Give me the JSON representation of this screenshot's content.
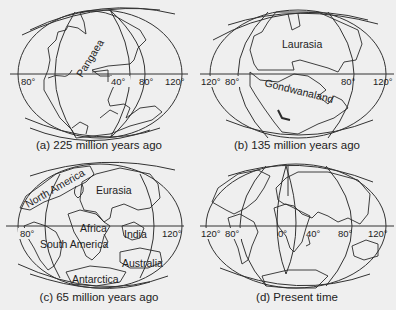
{
  "figure": {
    "background": "#efefef",
    "line_color": "#2a2a2a",
    "panels": [
      {
        "id": "a",
        "caption": "(a) 225 million years ago",
        "longitude_labels": [
          "80°",
          "40°",
          "80°",
          "120°"
        ],
        "landmass_labels": [
          "Pangaea"
        ]
      },
      {
        "id": "b",
        "caption": "(b) 135 million years ago",
        "longitude_labels": [
          "120°",
          "80°",
          "80°",
          "120°"
        ],
        "landmass_labels": [
          "Laurasia",
          "Gondwanaland"
        ]
      },
      {
        "id": "c",
        "caption": "(c) 65 million years ago",
        "longitude_labels": [
          "80°",
          "120°"
        ],
        "landmass_labels": [
          "North America",
          "Eurasia",
          "Africa",
          "South America",
          "India",
          "Australia",
          "Antarctica"
        ]
      },
      {
        "id": "d",
        "caption": "(d) Present time",
        "longitude_labels": [
          "120°",
          "80°",
          "0°",
          "40°",
          "80°",
          "120°"
        ],
        "landmass_labels": []
      }
    ]
  }
}
